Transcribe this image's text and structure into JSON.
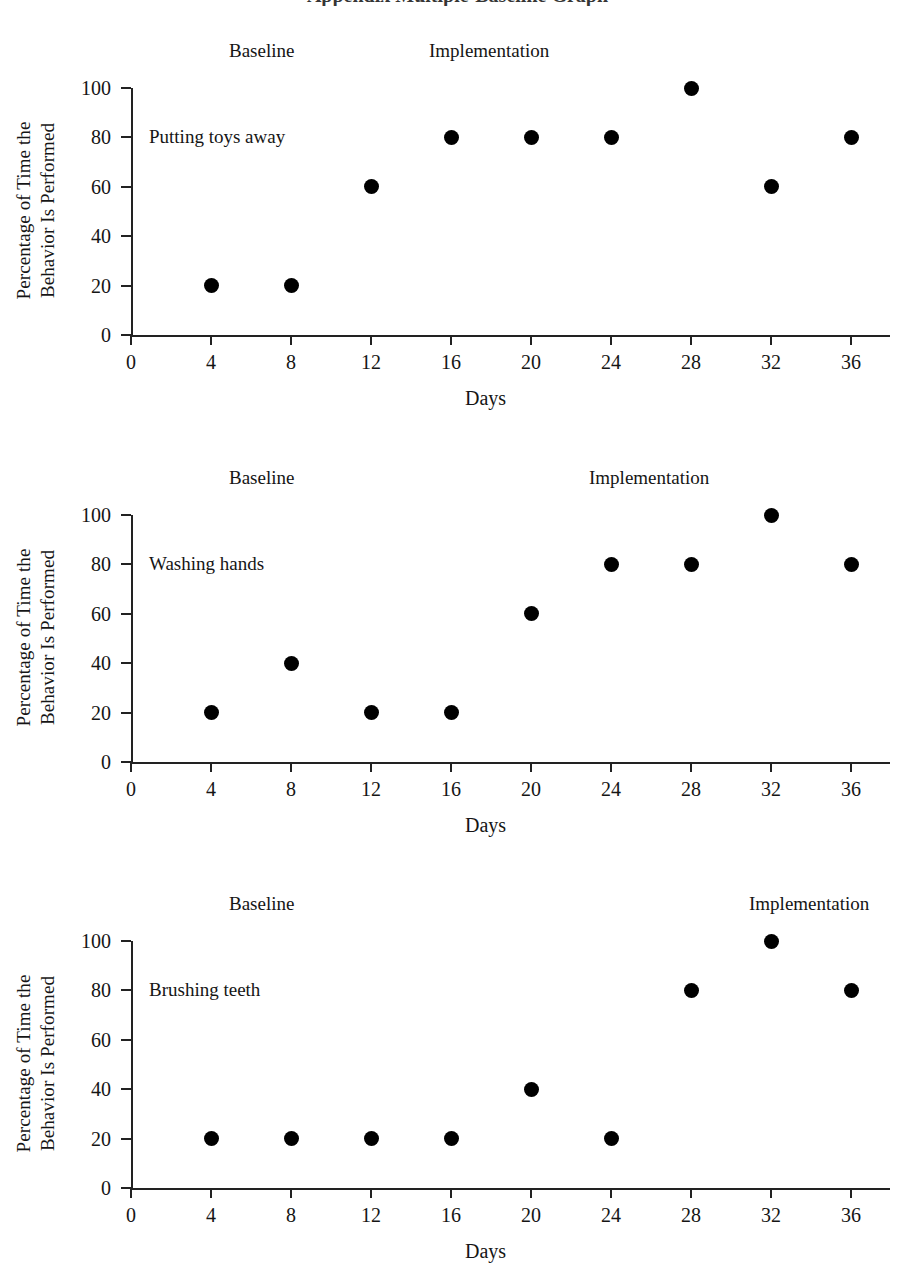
{
  "page": {
    "title_partial": "Appendix  Multiple-Baseline Graph"
  },
  "axis": {
    "y_label_line1": "Percentage of Time the",
    "y_label_line2": "Behavior Is Performed",
    "x_label": "Days",
    "y_ticks": [
      "0",
      "20",
      "40",
      "60",
      "80",
      "100"
    ],
    "x_ticks": [
      "0",
      "4",
      "8",
      "12",
      "16",
      "20",
      "24",
      "28",
      "32",
      "36"
    ]
  },
  "phases": {
    "baseline": "Baseline",
    "implementation": "Implementation"
  },
  "chart_data": [
    {
      "type": "scatter",
      "title": "Putting toys away",
      "series_label": "Putting toys away",
      "xlabel": "Days",
      "ylabel": "Percentage of Time the Behavior Is Performed",
      "xlim": [
        0,
        38
      ],
      "ylim": [
        0,
        100
      ],
      "x": [
        4,
        8,
        12,
        16,
        20,
        24,
        28,
        32,
        36
      ],
      "values": [
        20,
        20,
        60,
        80,
        80,
        80,
        100,
        60,
        80
      ],
      "grid": false,
      "phase_labels": [
        {
          "text": "Baseline",
          "x": 4
        },
        {
          "text": "Implementation",
          "x": 14
        }
      ],
      "phase_change_after_day": 8
    },
    {
      "type": "scatter",
      "title": "Washing hands",
      "series_label": "Washing hands",
      "xlabel": "Days",
      "ylabel": "Percentage of Time the Behavior Is Performed",
      "xlim": [
        0,
        38
      ],
      "ylim": [
        0,
        100
      ],
      "x": [
        4,
        8,
        12,
        16,
        20,
        24,
        28,
        32,
        36
      ],
      "values": [
        20,
        40,
        20,
        20,
        60,
        80,
        80,
        100,
        80
      ],
      "grid": false,
      "phase_labels": [
        {
          "text": "Baseline",
          "x": 4
        },
        {
          "text": "Implementation",
          "x": 22
        }
      ],
      "phase_change_after_day": 16
    },
    {
      "type": "scatter",
      "title": "Brushing teeth",
      "series_label": "Brushing teeth",
      "xlabel": "Days",
      "ylabel": "Percentage of Time the Behavior Is Performed",
      "xlim": [
        0,
        38
      ],
      "ylim": [
        0,
        100
      ],
      "x": [
        4,
        8,
        12,
        16,
        20,
        24,
        28,
        32,
        36
      ],
      "values": [
        20,
        20,
        20,
        20,
        40,
        20,
        80,
        100,
        80
      ],
      "grid": false,
      "phase_labels": [
        {
          "text": "Baseline",
          "x": 4
        },
        {
          "text": "Implementation",
          "x": 30
        }
      ],
      "phase_change_after_day": 24
    }
  ]
}
